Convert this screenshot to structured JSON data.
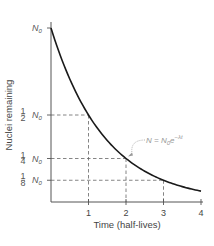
{
  "chart_data": {
    "type": "line",
    "title": "",
    "xlabel": "Time (half-lives)",
    "ylabel": "Nuclei remaining",
    "x_ticks": [
      "1",
      "2",
      "3",
      "4"
    ],
    "y_ticks": [
      {
        "value": 1.0,
        "label_num": "",
        "label_den": "",
        "label_sym": "N",
        "label_sub": "0"
      },
      {
        "value": 0.5,
        "label_num": "1",
        "label_den": "2",
        "label_sym": "N",
        "label_sub": "0"
      },
      {
        "value": 0.25,
        "label_num": "1",
        "label_den": "4",
        "label_sym": "N",
        "label_sub": "0"
      },
      {
        "value": 0.125,
        "label_num": "1",
        "label_den": "8",
        "label_sym": "N",
        "label_sub": "0"
      }
    ],
    "xlim": [
      0,
      4
    ],
    "ylim": [
      0,
      1
    ],
    "grid": false,
    "series": [
      {
        "name": "N = N0 e^(-λt)",
        "x": [
          0,
          0.5,
          1,
          1.5,
          2,
          2.5,
          3,
          3.5,
          4
        ],
        "values": [
          1.0,
          0.707,
          0.5,
          0.354,
          0.25,
          0.177,
          0.125,
          0.088,
          0.0625
        ]
      }
    ],
    "guides": [
      {
        "x": 1,
        "y": 0.5
      },
      {
        "x": 2,
        "y": 0.25
      },
      {
        "x": 3,
        "y": 0.125
      }
    ],
    "annotation": {
      "text_lhs": "N = N",
      "text_sub": "0",
      "text_e": "e",
      "text_exp": "−λt",
      "points_to": {
        "x": 2,
        "y": 0.25
      }
    }
  },
  "colors": {
    "curve": "#1a1a1a",
    "axis": "#555555",
    "guide": "#666666",
    "annotation": "#999999"
  }
}
